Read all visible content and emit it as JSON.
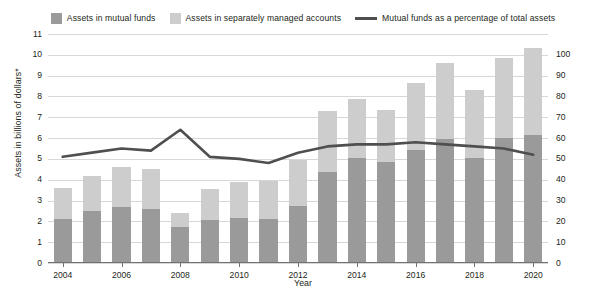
{
  "legend": {
    "items": [
      {
        "label": "Assets in mutual funds",
        "type": "swatch",
        "color": "#9a9a9a",
        "icon": "square-swatch-icon"
      },
      {
        "label": "Assets in separately managed accounts",
        "type": "swatch",
        "color": "#cdcdcd",
        "icon": "square-swatch-icon"
      },
      {
        "label": "Mutual funds as a percentage of total assets",
        "type": "line",
        "color": "#4f4f4f",
        "icon": "line-swatch-icon"
      }
    ]
  },
  "chart_data": {
    "type": "bar",
    "title": "",
    "xlabel": "Year",
    "ylabel": "Assets in billions of dollars*",
    "y2label": "Percentage of funds/assets under management (line)",
    "categories": [
      2004,
      2005,
      2006,
      2007,
      2008,
      2009,
      2010,
      2011,
      2012,
      2013,
      2014,
      2015,
      2016,
      2017,
      2018,
      2019,
      2020
    ],
    "xtick_labels": [
      "2004",
      "2006",
      "2008",
      "2010",
      "2012",
      "2014",
      "2016",
      "2018",
      "2020"
    ],
    "ylim": [
      0,
      11
    ],
    "ytick_labels": [
      "0",
      "1",
      "2",
      "3",
      "4",
      "5",
      "6",
      "7",
      "8",
      "9",
      "10",
      "11"
    ],
    "y2lim": [
      0,
      110
    ],
    "y2tick_labels": [
      "0",
      "10",
      "20",
      "30",
      "40",
      "50",
      "60",
      "70",
      "80",
      "90",
      "100"
    ],
    "grid": true,
    "stacked": true,
    "legend_position": "top",
    "series": [
      {
        "name": "Assets in mutual funds",
        "axis": "left",
        "color": "#9a9a9a",
        "values": [
          2.1,
          2.5,
          2.7,
          2.6,
          1.75,
          2.05,
          2.15,
          2.1,
          2.75,
          4.35,
          5.05,
          4.85,
          5.45,
          5.95,
          5.05,
          6.0,
          6.15
        ]
      },
      {
        "name": "Assets in separately managed accounts",
        "axis": "left",
        "color": "#cdcdcd",
        "values": [
          1.5,
          1.7,
          1.9,
          1.9,
          0.65,
          1.5,
          1.75,
          1.85,
          2.2,
          2.95,
          2.85,
          2.5,
          3.2,
          3.65,
          3.25,
          3.85,
          4.2
        ]
      },
      {
        "name": "Mutual funds as a percentage of total assets",
        "axis": "right",
        "color": "#4f4f4f",
        "type": "line",
        "values": [
          51,
          53,
          55,
          54,
          64,
          51,
          50,
          48,
          53,
          56,
          57,
          57,
          58,
          57,
          56,
          55,
          52
        ]
      }
    ],
    "total_values": [
      3.6,
      4.2,
      4.6,
      4.5,
      2.4,
      3.55,
      3.9,
      3.95,
      4.95,
      7.3,
      7.9,
      7.35,
      8.65,
      9.6,
      8.3,
      9.85,
      10.35
    ]
  }
}
